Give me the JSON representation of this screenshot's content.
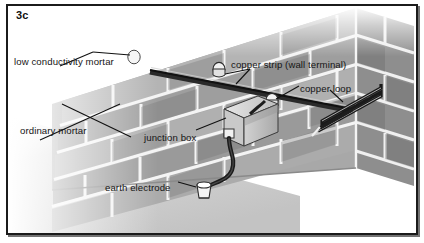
{
  "figure": {
    "id_label": "3c",
    "caption": "",
    "frame_color": "#1b1b1b",
    "background": "#ffffff"
  },
  "palette": {
    "brick_light": "#b9b9b9",
    "brick_mid": "#9d9d9d",
    "brick_dark": "#868686",
    "mortar_joint": "#f2f2f2",
    "ground": "#cfcfcf",
    "metal_dark": "#1a1a1a",
    "fixing_white": "#f4f4f4",
    "leader_line": "#111111"
  },
  "labels": [
    {
      "name": "low-conductivity-mortar",
      "text": "low conductivity mortar",
      "x": 14,
      "y": 57
    },
    {
      "name": "copper-strip-wall-terminal",
      "text": "copper strip (wall terminal)",
      "x": 231,
      "y": 60
    },
    {
      "name": "copper-loop",
      "text": "copper loop",
      "x": 300,
      "y": 84
    },
    {
      "name": "ordinary-mortar",
      "text": "ordinary mortar",
      "x": 20,
      "y": 126
    },
    {
      "name": "junction-box",
      "text": "junction box",
      "x": 144,
      "y": 133
    },
    {
      "name": "earth-electrode",
      "text": "earth electrode",
      "x": 105,
      "y": 183
    }
  ],
  "components": [
    {
      "name": "copper-strip",
      "description": "horizontal copper strip fixed along the wall"
    },
    {
      "name": "wall-terminal-fixing-left",
      "description": "cylindrical white terminal fixing on strip"
    },
    {
      "name": "wall-terminal-fixing-right",
      "description": "cylindrical white terminal fixing on strip"
    },
    {
      "name": "copper-loop",
      "description": "hairpin copper loop at wall corner"
    },
    {
      "name": "junction-box",
      "description": "rectangular junction box mounted on wall"
    },
    {
      "name": "down-conductor-cable",
      "description": "cable from junction box to earth electrode"
    },
    {
      "name": "earth-electrode",
      "description": "earth electrode terminal at ground level"
    },
    {
      "name": "brick-wall",
      "description": "perspective brick wall with mortar joints"
    },
    {
      "name": "ground-plane",
      "description": "ground surface in front of wall"
    }
  ]
}
